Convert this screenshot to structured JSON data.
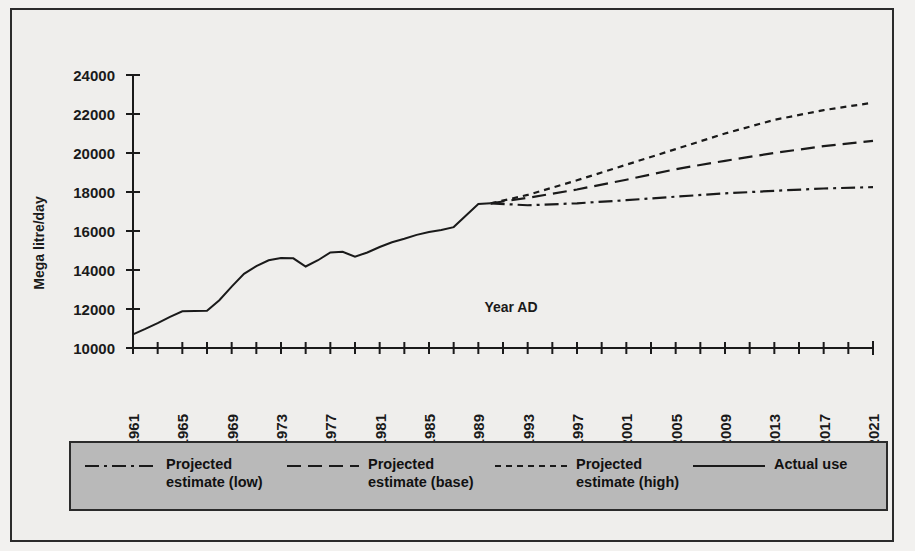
{
  "chart_data": {
    "type": "line",
    "title": "",
    "xlabel": "Year AD",
    "ylabel": "Mega litre/day",
    "xlim": [
      1961,
      2021
    ],
    "ylim": [
      10000,
      24000
    ],
    "y_ticks": [
      10000,
      12000,
      14000,
      16000,
      18000,
      20000,
      22000,
      24000
    ],
    "x_tick_labels": [
      1961,
      1965,
      1969,
      1973,
      1977,
      1981,
      1985,
      1989,
      1993,
      1997,
      2001,
      2005,
      2009,
      2013,
      2017,
      2021
    ],
    "x_minor_tick_step": 2,
    "grid": false,
    "legend_position": "bottom",
    "series": [
      {
        "name": "Actual use",
        "style": "solid",
        "x": [
          1961,
          1962,
          1963,
          1964,
          1965,
          1966,
          1967,
          1968,
          1969,
          1970,
          1971,
          1972,
          1973,
          1974,
          1975,
          1976,
          1977,
          1978,
          1979,
          1980,
          1981,
          1982,
          1983,
          1984,
          1985,
          1986,
          1987,
          1988,
          1989,
          1990
        ],
        "values": [
          10700,
          10980,
          11280,
          11600,
          11880,
          11900,
          11910,
          12450,
          13150,
          13800,
          14200,
          14500,
          14620,
          14600,
          14180,
          14500,
          14900,
          14930,
          14680,
          14900,
          15180,
          15420,
          15600,
          15800,
          15950,
          16050,
          16200,
          16800,
          17380,
          17420
        ]
      },
      {
        "name": "Projected estimate (low)",
        "style": "dash-dot",
        "x": [
          1990,
          1993,
          1997,
          2001,
          2005,
          2009,
          2013,
          2017,
          2021
        ],
        "values": [
          17420,
          17320,
          17420,
          17580,
          17760,
          17930,
          18060,
          18180,
          18250
        ]
      },
      {
        "name": "Projected estimate (base)",
        "style": "dashed",
        "x": [
          1990,
          1993,
          1997,
          2001,
          2005,
          2009,
          2013,
          2017,
          2021
        ],
        "values": [
          17420,
          17700,
          18130,
          18630,
          19170,
          19600,
          20000,
          20350,
          20620
        ]
      },
      {
        "name": "Projected estimate (high)",
        "style": "dotted",
        "x": [
          1990,
          1993,
          1997,
          2001,
          2005,
          2009,
          2013,
          2017,
          2021
        ],
        "values": [
          17420,
          17850,
          18600,
          19400,
          20200,
          21000,
          21700,
          22200,
          22580
        ]
      }
    ]
  },
  "legend": {
    "entries": [
      {
        "label": "Projected\nestimate (low)",
        "style": "dash-dot"
      },
      {
        "label": "Projected\nestimate (base)",
        "style": "dashed"
      },
      {
        "label": "Projected\nestimate (high)",
        "style": "dotted"
      },
      {
        "label": "Actual use",
        "style": "solid"
      }
    ]
  },
  "colors": {
    "line": "#1a1a1a",
    "background": "#efeeec",
    "legend_background": "#b9b9b9",
    "frame": "#2b2b2b"
  }
}
